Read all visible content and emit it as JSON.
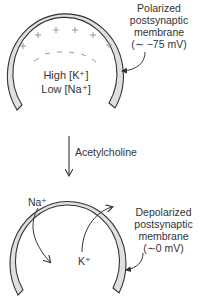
{
  "top_panel": {
    "title_lines": [
      "Polarized",
      "postsynaptic",
      "membrane",
      "(∼ −75 mV)"
    ],
    "inside_lines": [
      "High [K⁺]",
      "Low [Na⁺]"
    ],
    "outside_charge": "+",
    "inside_charge": "−"
  },
  "transition": {
    "label": "Acetylcholine"
  },
  "bottom_panel": {
    "title_lines": [
      "Depolarized",
      "postsynaptic",
      "membrane",
      "(∼0 mV)"
    ],
    "ion_in": "Na⁺",
    "ion_out": "K⁺"
  },
  "colors": {
    "membrane_fill": "#e0e0e0",
    "stroke": "#333333",
    "charge": "#999999"
  }
}
